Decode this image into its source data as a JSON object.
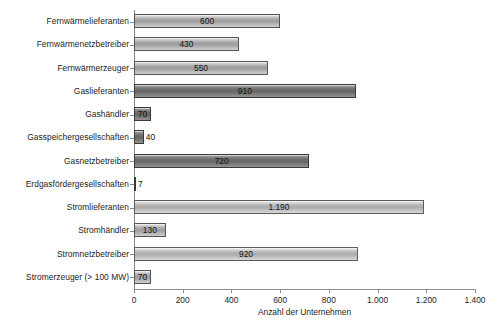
{
  "chart_data": {
    "type": "bar",
    "orientation": "horizontal",
    "title": "",
    "xlabel": "Anzahl der Unternehmen",
    "ylabel": "",
    "xlim": [
      0,
      1400
    ],
    "xticks": [
      "0",
      "200",
      "400",
      "600",
      "800",
      "1.000",
      "1.200",
      "1.400"
    ],
    "xtick_values": [
      0,
      200,
      400,
      600,
      800,
      1000,
      1200,
      1400
    ],
    "grid": false,
    "legend": null,
    "categories": [
      "Fernwärmelieferanten",
      "Fernwärmenetzbetreiber",
      "Fernwärmerzeuger",
      "Gaslieferanten",
      "Gashändler",
      "Gasspeichergesellschaften",
      "Gasnetzbetreiber",
      "Erdgasfördergesellschaften",
      "Stromlieferanten",
      "Stromhändler",
      "Stromnetzbetreiber",
      "Stromerzeuger (> 100 MW)"
    ],
    "values": [
      600,
      430,
      550,
      910,
      70,
      40,
      720,
      7,
      1190,
      130,
      920,
      70
    ],
    "value_labels": [
      "600",
      "430",
      "550",
      "910",
      "70",
      "40",
      "720",
      "7",
      "1.190",
      "130",
      "920",
      "70"
    ],
    "bars": [
      {
        "category": "Fernwärmelieferanten",
        "value": 600,
        "label": "600",
        "shade": "mid",
        "label_position": "inside"
      },
      {
        "category": "Fernwärmenetzbetreiber",
        "value": 430,
        "label": "430",
        "shade": "mid",
        "label_position": "inside"
      },
      {
        "category": "Fernwärmerzeuger",
        "value": 550,
        "label": "550",
        "shade": "mid",
        "label_position": "inside"
      },
      {
        "category": "Gaslieferanten",
        "value": 910,
        "label": "910",
        "shade": "dark",
        "label_position": "inside"
      },
      {
        "category": "Gashändler",
        "value": 70,
        "label": "70",
        "shade": "dark",
        "label_position": "inside"
      },
      {
        "category": "Gasspeichergesellschaften",
        "value": 40,
        "label": "40",
        "shade": "dark",
        "label_position": "outside"
      },
      {
        "category": "Gasnetzbetreiber",
        "value": 720,
        "label": "720",
        "shade": "dark",
        "label_position": "inside"
      },
      {
        "category": "Erdgasfördergesellschaften",
        "value": 7,
        "label": "7",
        "shade": "dark",
        "label_position": "outside"
      },
      {
        "category": "Stromlieferanten",
        "value": 1190,
        "label": "1.190",
        "shade": "light",
        "label_position": "inside"
      },
      {
        "category": "Stromhändler",
        "value": 130,
        "label": "130",
        "shade": "mid",
        "label_position": "inside"
      },
      {
        "category": "Stromnetzbetreiber",
        "value": 920,
        "label": "920",
        "shade": "light",
        "label_position": "inside"
      },
      {
        "category": "Stromerzeuger (> 100 MW)",
        "value": 70,
        "label": "70",
        "shade": "mid",
        "label_position": "inside"
      }
    ]
  },
  "colors": {
    "axis": "#8a8a8a",
    "text": "#1c1c1c",
    "bar_mid": "#a8a8a8",
    "bar_dark": "#6e6e6e",
    "bar_light": "#bdbdbd",
    "background": "#ffffff"
  }
}
